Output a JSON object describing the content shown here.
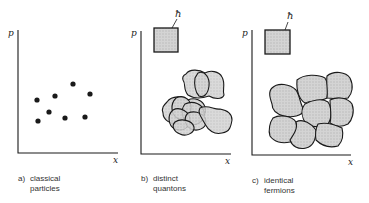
{
  "panels": [
    {
      "id": "a",
      "tag": "a)",
      "caption_line1": "classical",
      "caption_line2": "particles",
      "y_axis": "p",
      "x_axis": "x",
      "points": [
        [
          37,
          100
        ],
        [
          55,
          96
        ],
        [
          73,
          84
        ],
        [
          90,
          94
        ],
        [
          49,
          112
        ],
        [
          38,
          121
        ],
        [
          65,
          118
        ],
        [
          85,
          117
        ]
      ]
    },
    {
      "id": "b",
      "tag": "b)",
      "caption_line1": "distinct",
      "caption_line2": "quantons",
      "y_axis": "p",
      "x_axis": "x",
      "cell_label": "ħ"
    },
    {
      "id": "c",
      "tag": "c)",
      "caption_line1": "identical",
      "caption_line2": "fermions",
      "y_axis": "p",
      "x_axis": "x",
      "cell_label": "ħ"
    }
  ],
  "colors": {
    "ink": "#1a1a1a",
    "fill": "#c9c9c9"
  }
}
